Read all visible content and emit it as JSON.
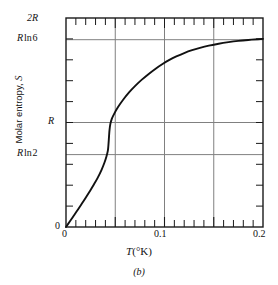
{
  "figure": {
    "caption": "(b)",
    "xlabel_italic": "T",
    "xlabel_units": "(°K)",
    "ylabel_text": "Molar entropy,",
    "ylabel_symbol": "S"
  },
  "axes": {
    "x_tick_labels": [
      {
        "value": 0,
        "text": "0"
      },
      {
        "value": 0.1,
        "text": "0.1"
      },
      {
        "value": 0.2,
        "text": "0.2"
      }
    ],
    "y_tick_labels": [
      {
        "value": 0,
        "text": "0",
        "italic_lead": ""
      },
      {
        "value": 0.693,
        "text": "ln 2",
        "italic_lead": "R"
      },
      {
        "value": 1.0,
        "text": "",
        "italic_lead": "R"
      },
      {
        "value": 1.792,
        "text": "ln 6",
        "italic_lead": "R"
      },
      {
        "value": 2.0,
        "text": "",
        "italic_lead": "2R"
      }
    ],
    "frame_color": "#222222",
    "grid_color": "#777777",
    "curve_color": "#111111"
  },
  "chart_data": {
    "type": "line",
    "title": "",
    "subtitle": "",
    "xlabel": "T (°K)",
    "ylabel": "Molar entropy, S",
    "xlim": [
      0,
      0.2
    ],
    "ylim": [
      0,
      2
    ],
    "y_units": "R (gas constant)",
    "grid": true,
    "legend": "none",
    "x_major_ticks": [
      0,
      0.05,
      0.1,
      0.15,
      0.2
    ],
    "x_minor_tick_step": 0.01,
    "y_gridlines": [
      0.693,
      1.0,
      1.792
    ],
    "y_gridline_labels": [
      "R ln 2",
      "R",
      "R ln 6"
    ],
    "y_minor_tick_step": 0.1,
    "annotations": [
      "lambda-type sharp rise near T = 0.043 K"
    ],
    "series": [
      {
        "name": "Molar entropy S(T)",
        "x": [
          0.0,
          0.004,
          0.008,
          0.012,
          0.016,
          0.02,
          0.024,
          0.028,
          0.032,
          0.036,
          0.039,
          0.041,
          0.0425,
          0.0432,
          0.0437,
          0.0442,
          0.045,
          0.0465,
          0.049,
          0.053,
          0.058,
          0.064,
          0.07,
          0.077,
          0.084,
          0.091,
          0.098,
          0.105,
          0.112,
          0.12,
          0.128,
          0.136,
          0.145,
          0.155,
          0.165,
          0.175,
          0.185,
          0.195,
          0.2
        ],
        "y": [
          0.0,
          0.055,
          0.11,
          0.165,
          0.222,
          0.28,
          0.34,
          0.402,
          0.468,
          0.545,
          0.615,
          0.672,
          0.73,
          0.8,
          0.87,
          0.93,
          0.985,
          1.035,
          1.085,
          1.15,
          1.218,
          1.288,
          1.348,
          1.41,
          1.465,
          1.515,
          1.56,
          1.6,
          1.633,
          1.665,
          1.692,
          1.714,
          1.735,
          1.754,
          1.769,
          1.781,
          1.79,
          1.797,
          1.8
        ]
      }
    ]
  }
}
